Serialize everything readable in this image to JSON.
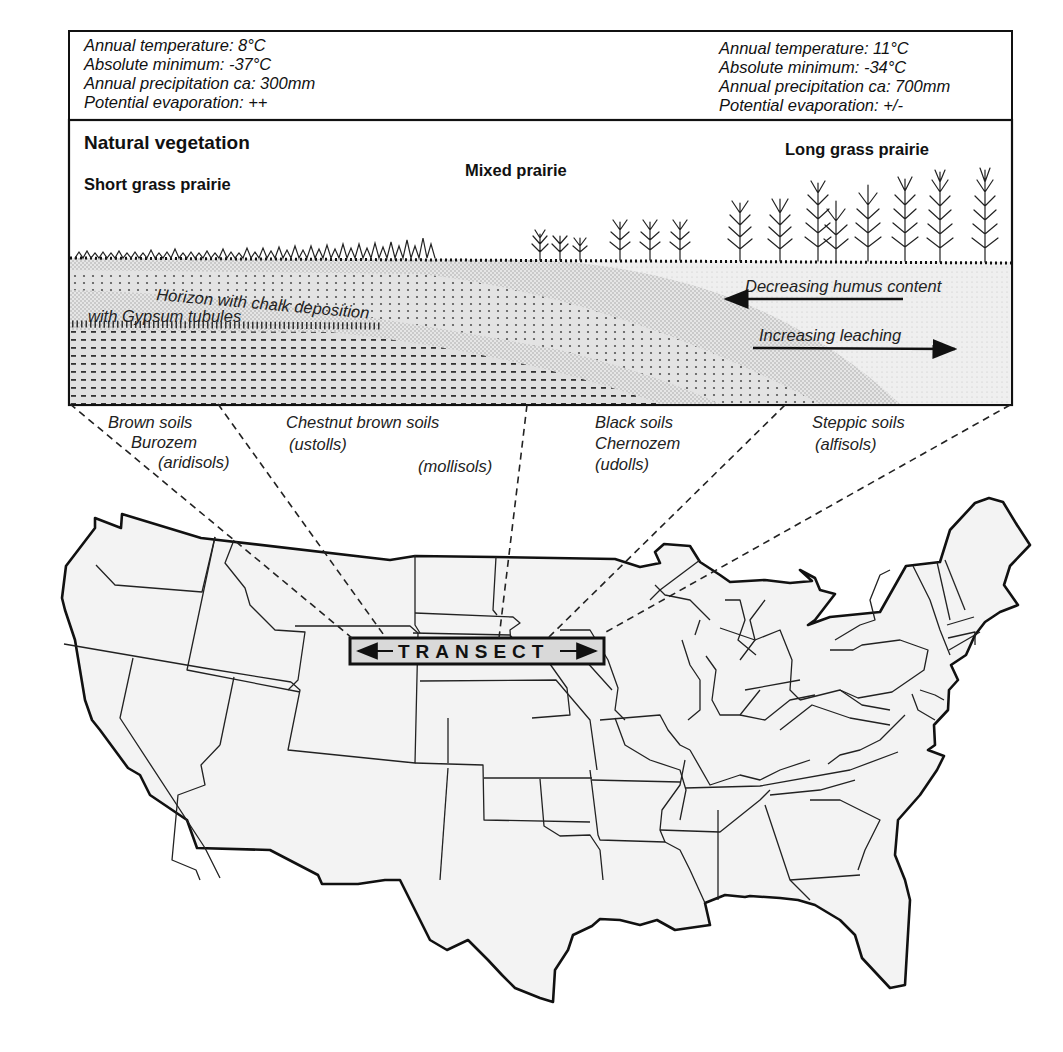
{
  "climate": {
    "west": {
      "annual_temperature": "Annual temperature: 8°C",
      "absolute_minimum": "Absolute minimum: -37°C",
      "annual_precipitation": "Annual precipitation ca: 300mm",
      "potential_evaporation": "Potential evaporation: ++"
    },
    "east": {
      "annual_temperature": "Annual temperature: 11°C",
      "absolute_minimum": "Absolute minimum: -34°C",
      "annual_precipitation": "Annual precipitation ca: 700mm",
      "potential_evaporation": "Potential evaporation: +/-"
    }
  },
  "vegetation": {
    "title": "Natural vegetation",
    "zones": [
      {
        "label": "Short grass prairie"
      },
      {
        "label": "Mixed prairie"
      },
      {
        "label": "Long grass prairie"
      }
    ]
  },
  "soil_profile": {
    "horizon_line1": "Horizon with  chalk deposition",
    "horizon_line2": "with Gypsum tubules",
    "humus_trend": "Decreasing humus content",
    "leaching_trend": "Increasing leaching",
    "humus_arrow_direction": "left",
    "leaching_arrow_direction": "right"
  },
  "soil_types": [
    {
      "lines": [
        "Brown soils",
        "Burozem",
        "(aridisols)"
      ]
    },
    {
      "lines": [
        "Chestnut brown soils",
        "(ustolls)"
      ]
    },
    {
      "lines": [
        "(mollisols)"
      ]
    },
    {
      "lines": [
        "Black soils",
        "Chernozem",
        "(udolls)"
      ]
    },
    {
      "lines": [
        "Steppic soils",
        "(alfisols)"
      ]
    }
  ],
  "map": {
    "region": "Contiguous United States",
    "transect_label": "TRANSECT",
    "colors": {
      "land_fill": "#f3f3f3",
      "transect_box_fill": "#d9d9d9",
      "outline": "#111111"
    }
  }
}
